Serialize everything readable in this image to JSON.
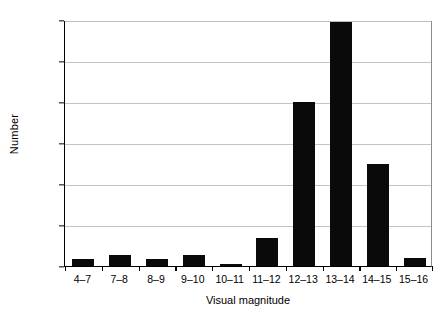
{
  "chart_data": {
    "type": "bar",
    "title": "",
    "subtitle": "",
    "xlabel": "Visual magnitude",
    "ylabel": "Number",
    "categories": [
      "4–7",
      "7–8",
      "8–9",
      "9–10",
      "10–11",
      "11–12",
      "12–13",
      "13–14",
      "14–15",
      "15–16"
    ],
    "values": [
      4,
      7,
      4,
      7,
      1,
      17,
      100,
      149,
      62,
      5
    ],
    "series": [
      {
        "name": "Number",
        "values": [
          4,
          7,
          4,
          7,
          1,
          17,
          100,
          149,
          62,
          5
        ]
      }
    ],
    "ylim": [
      0,
      150
    ],
    "yticks": [
      0,
      25,
      50,
      75,
      100,
      125,
      150
    ],
    "ytick_labels": [
      "0",
      "25",
      "50",
      "75",
      "100",
      "125",
      "150"
    ],
    "grid": "horizontal",
    "legend": "none",
    "bar_color": "#0a0a0a",
    "gridline_color": "#c4c4c4",
    "axis_color": "#000000",
    "background_color": "#ffffff"
  }
}
